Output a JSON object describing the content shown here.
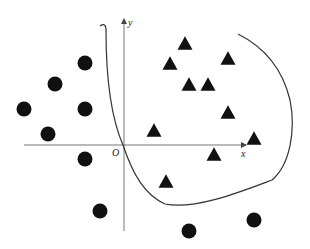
{
  "diagram": {
    "type": "scatter-classification",
    "axes": {
      "origin_label": "O",
      "x_label": "x",
      "y_label": "y",
      "origin_px": [
        123,
        145
      ],
      "x_axis_px": {
        "from": 24,
        "to": 246
      },
      "y_axis_px": {
        "from": 231,
        "to": 20
      }
    },
    "colors": {
      "points": "#111111",
      "axes": "#555555",
      "curve": "#333333",
      "background": "#ffffff"
    },
    "classes": {
      "circles": {
        "label": "circle-class",
        "radius": 7.5,
        "points": [
          [
            85,
            63
          ],
          [
            55,
            84
          ],
          [
            24,
            109
          ],
          [
            85,
            109
          ],
          [
            48,
            134
          ],
          [
            85,
            159
          ],
          [
            100,
            211
          ],
          [
            189,
            231
          ],
          [
            254,
            220
          ]
        ]
      },
      "triangles": {
        "label": "triangle-class",
        "size": 15,
        "points": [
          [
            185,
            43
          ],
          [
            170,
            63
          ],
          [
            228,
            58
          ],
          [
            189,
            84
          ],
          [
            208,
            84
          ],
          [
            228,
            112
          ],
          [
            154,
            130
          ],
          [
            254,
            138
          ],
          [
            214,
            154
          ],
          [
            166,
            181
          ]
        ]
      }
    },
    "boundary_curve": {
      "path": "M 100 26 Q 106 22 106 30 C 106 80 112 120 123 145 C 133 175 145 195 165 204 C 195 210 240 192 272 180 C 290 165 296 130 290 100 C 284 75 270 50 238 34"
    }
  }
}
